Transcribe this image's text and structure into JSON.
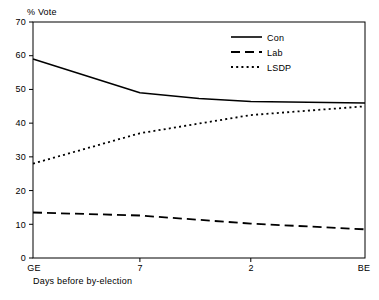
{
  "chart_data": {
    "type": "line",
    "title": "",
    "xlabel": "Days before by-election",
    "ylabel": "% Vote",
    "ylim": [
      0,
      70
    ],
    "ytick_labels": [
      "0",
      "10",
      "20",
      "30",
      "40",
      "50",
      "60",
      "70"
    ],
    "ytick_values": [
      0,
      10,
      20,
      30,
      40,
      50,
      60,
      70
    ],
    "xtick_labels": [
      "GE",
      "7",
      "2",
      "BE"
    ],
    "xtick_positions": [
      0,
      0.322,
      0.656,
      1
    ],
    "grid": false,
    "legend_position": "top-right",
    "series": [
      {
        "name": "Con",
        "style": "solid",
        "color": "#000000",
        "x": [
          0,
          0.322,
          0.5,
          0.656,
          1
        ],
        "values": [
          59,
          49,
          47.3,
          46.4,
          46
        ]
      },
      {
        "name": "Lab",
        "style": "dashed",
        "color": "#000000",
        "x": [
          0,
          0.322,
          0.656,
          1
        ],
        "values": [
          13.5,
          12.6,
          10.2,
          8.5
        ]
      },
      {
        "name": "LSDP",
        "style": "dotted",
        "color": "#000000",
        "x": [
          0,
          0.322,
          0.656,
          1
        ],
        "values": [
          28,
          37,
          42.4,
          45
        ]
      }
    ]
  },
  "axes": {
    "y_title": "% Vote",
    "x_title": "Days before by-election",
    "y_ticks": [
      {
        "label": "70"
      },
      {
        "label": "60"
      },
      {
        "label": "50"
      },
      {
        "label": "40"
      },
      {
        "label": "30"
      },
      {
        "label": "20"
      },
      {
        "label": "10"
      },
      {
        "label": "0"
      }
    ],
    "x_ticks": [
      {
        "label": "GE"
      },
      {
        "label": "7"
      },
      {
        "label": "2"
      },
      {
        "label": "BE"
      }
    ]
  },
  "legend": {
    "entries": [
      {
        "label": "Con",
        "style": "solid"
      },
      {
        "label": "Lab",
        "style": "dashed"
      },
      {
        "label": "LSDP",
        "style": "dotted"
      }
    ]
  }
}
